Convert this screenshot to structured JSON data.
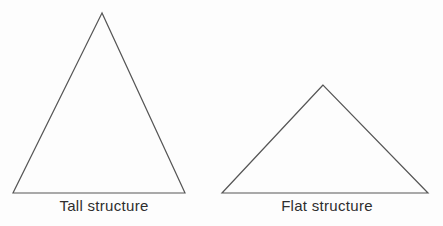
{
  "diagram": {
    "background_color": "#fdfdfd",
    "stroke_color": "#565656",
    "label_color": "#2e2e2e",
    "tall_triangle": {
      "label": "Tall structure",
      "points": "102,13 13,193 185,193"
    },
    "flat_triangle": {
      "label": "Flat structure",
      "points": "323,85 222,193 428,193"
    }
  }
}
